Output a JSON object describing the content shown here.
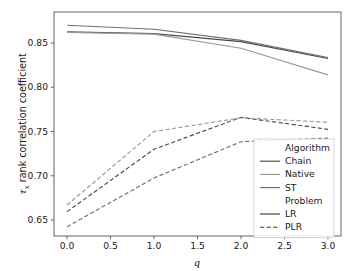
{
  "figure": {
    "background_color": "#ffffff",
    "width": 359,
    "height": 271
  },
  "chart_data": {
    "type": "line",
    "title": "",
    "xlabel": "q",
    "ylabel": "τ_x rank correlation coefficient",
    "ylabel_prefix": "τ",
    "ylabel_sub": "x",
    "ylabel_rest": " rank correlation coefficient",
    "x": [
      0.0,
      1.0,
      2.0,
      3.0
    ],
    "xlim": [
      -0.15,
      3.15
    ],
    "ylim": [
      0.632,
      0.885
    ],
    "xticks": [
      0.0,
      0.5,
      1.0,
      1.5,
      2.0,
      2.5,
      3.0
    ],
    "xtick_labels": [
      "0.0",
      "0.5",
      "1.0",
      "1.5",
      "2.0",
      "2.5",
      "3.0"
    ],
    "yticks": [
      0.65,
      0.7,
      0.75,
      0.8,
      0.85
    ],
    "ytick_labels": [
      "0.65",
      "0.70",
      "0.75",
      "0.80",
      "0.85"
    ],
    "grid": false,
    "legend_position": "lower right",
    "series": [
      {
        "name": "Chain-LR",
        "algorithm": "Chain",
        "problem": "LR",
        "color": "#4a4a4a",
        "dash": "none",
        "width": 1.15,
        "values": [
          0.8625,
          0.8605,
          0.8515,
          0.8325
        ]
      },
      {
        "name": "Native-LR",
        "algorithm": "Native",
        "problem": "LR",
        "color": "#9a9a9a",
        "dash": "none",
        "width": 1.15,
        "values": [
          0.862,
          0.86,
          0.844,
          0.814
        ]
      },
      {
        "name": "ST-LR",
        "algorithm": "ST",
        "problem": "LR",
        "color": "#707070",
        "dash": "none",
        "width": 1.15,
        "values": [
          0.87,
          0.8655,
          0.853,
          0.8335
        ]
      },
      {
        "name": "Chain-PLR",
        "algorithm": "Chain",
        "problem": "PLR",
        "color": "#4a4a4a",
        "dash": "dashed",
        "width": 1.15,
        "values": [
          0.6595,
          0.73,
          0.766,
          0.7525
        ]
      },
      {
        "name": "Native-PLR",
        "algorithm": "Native",
        "problem": "PLR",
        "color": "#9a9a9a",
        "dash": "dashed",
        "width": 1.15,
        "values": [
          0.667,
          0.75,
          0.7655,
          0.7605
        ]
      },
      {
        "name": "ST-PLR",
        "algorithm": "ST",
        "problem": "PLR",
        "color": "#707070",
        "dash": "dashed",
        "width": 1.15,
        "values": [
          0.6425,
          0.6975,
          0.7385,
          0.7425
        ]
      }
    ],
    "legend": {
      "groups": [
        {
          "title": "Algorithm",
          "entries": [
            {
              "label": "Chain",
              "color": "#4a4a4a",
              "dash": "none"
            },
            {
              "label": "Native",
              "color": "#9a9a9a",
              "dash": "none"
            },
            {
              "label": "ST",
              "color": "#707070",
              "dash": "none"
            }
          ]
        },
        {
          "title": "Problem",
          "entries": [
            {
              "label": "LR",
              "color": "#3c3c3c",
              "dash": "none"
            },
            {
              "label": "PLR",
              "color": "#3c3c3c",
              "dash": "dashed"
            }
          ]
        }
      ]
    }
  }
}
